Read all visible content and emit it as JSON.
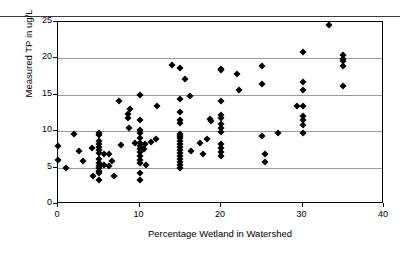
{
  "chart_data": {
    "type": "scatter",
    "title": "",
    "xlabel": "Percentage Wetland in Watershed",
    "ylabel": "Measured TP in ug/L",
    "xlim": [
      0,
      40
    ],
    "ylim": [
      0,
      25
    ],
    "xticks": [
      0,
      10,
      20,
      30,
      40
    ],
    "yticks": [
      0,
      5,
      10,
      15,
      20,
      25
    ],
    "xtick_labels": [
      "0",
      "10",
      "20",
      "30",
      "40"
    ],
    "ytick_labels": [
      "0",
      "5",
      "10",
      "15",
      "20",
      "25"
    ],
    "grid": "horizontal",
    "gridlines_y": [
      5,
      10,
      15,
      20
    ],
    "legend": "none",
    "marker": "diamond",
    "marker_color": "#000000",
    "series": [
      {
        "name": "Measured TP",
        "points": [
          [
            0.0,
            8.0
          ],
          [
            0.0,
            6.1
          ],
          [
            1.0,
            4.9
          ],
          [
            2.0,
            9.6
          ],
          [
            2.6,
            7.3
          ],
          [
            3.1,
            5.9
          ],
          [
            4.2,
            7.7
          ],
          [
            4.3,
            3.9
          ],
          [
            5.0,
            9.8
          ],
          [
            5.0,
            9.5
          ],
          [
            5.0,
            8.6
          ],
          [
            5.0,
            8.2
          ],
          [
            5.0,
            7.8
          ],
          [
            5.0,
            7.4
          ],
          [
            5.0,
            7.0
          ],
          [
            5.0,
            6.2
          ],
          [
            5.0,
            5.6
          ],
          [
            5.0,
            5.2
          ],
          [
            5.0,
            4.9
          ],
          [
            5.0,
            4.6
          ],
          [
            5.0,
            4.3
          ],
          [
            5.0,
            3.3
          ],
          [
            5.6,
            5.3
          ],
          [
            5.7,
            6.9
          ],
          [
            6.2,
            6.9
          ],
          [
            6.3,
            5.2
          ],
          [
            6.6,
            5.9
          ],
          [
            6.9,
            3.8
          ],
          [
            7.5,
            14.2
          ],
          [
            7.7,
            8.1
          ],
          [
            8.6,
            12.3
          ],
          [
            8.6,
            11.8
          ],
          [
            8.7,
            10.4
          ],
          [
            8.8,
            13.1
          ],
          [
            9.5,
            8.4
          ],
          [
            10.0,
            15.0
          ],
          [
            10.0,
            11.6
          ],
          [
            10.0,
            10.1
          ],
          [
            10.0,
            9.7
          ],
          [
            10.0,
            9.1
          ],
          [
            10.0,
            8.4
          ],
          [
            10.0,
            8.0
          ],
          [
            10.0,
            7.6
          ],
          [
            10.0,
            7.2
          ],
          [
            10.0,
            6.6
          ],
          [
            10.0,
            6.1
          ],
          [
            10.0,
            5.6
          ],
          [
            10.0,
            4.3
          ],
          [
            10.0,
            3.3
          ],
          [
            10.6,
            7.6
          ],
          [
            10.7,
            8.2
          ],
          [
            10.8,
            5.4
          ],
          [
            11.4,
            8.5
          ],
          [
            12.0,
            8.9
          ],
          [
            12.1,
            13.5
          ],
          [
            14.0,
            19.1
          ],
          [
            15.0,
            18.7
          ],
          [
            15.0,
            14.4
          ],
          [
            15.0,
            12.6
          ],
          [
            15.0,
            11.6
          ],
          [
            15.0,
            11.1
          ],
          [
            15.0,
            9.6
          ],
          [
            15.0,
            9.4
          ],
          [
            15.0,
            9.0
          ],
          [
            15.0,
            8.6
          ],
          [
            15.0,
            8.2
          ],
          [
            15.0,
            7.8
          ],
          [
            15.0,
            7.4
          ],
          [
            15.0,
            7.0
          ],
          [
            15.0,
            6.6
          ],
          [
            15.0,
            6.2
          ],
          [
            15.0,
            5.8
          ],
          [
            15.0,
            5.4
          ],
          [
            15.0,
            5.0
          ],
          [
            15.6,
            17.2
          ],
          [
            16.2,
            14.9
          ],
          [
            16.3,
            7.3
          ],
          [
            17.4,
            8.4
          ],
          [
            17.8,
            6.9
          ],
          [
            18.3,
            8.9
          ],
          [
            18.6,
            11.7
          ],
          [
            18.8,
            11.4
          ],
          [
            20.0,
            18.6
          ],
          [
            20.0,
            18.4
          ],
          [
            20.0,
            14.1
          ],
          [
            20.0,
            12.2
          ],
          [
            20.0,
            11.8
          ],
          [
            20.0,
            11.0
          ],
          [
            20.0,
            10.4
          ],
          [
            20.0,
            9.9
          ],
          [
            20.0,
            8.3
          ],
          [
            20.0,
            7.7
          ],
          [
            20.0,
            7.1
          ],
          [
            20.0,
            6.6
          ],
          [
            22.0,
            17.9
          ],
          [
            22.2,
            15.7
          ],
          [
            25.0,
            19.0
          ],
          [
            25.0,
            16.5
          ],
          [
            25.0,
            9.4
          ],
          [
            25.4,
            6.8
          ],
          [
            25.4,
            5.8
          ],
          [
            27.0,
            9.7
          ],
          [
            29.3,
            13.5
          ],
          [
            30.0,
            20.9
          ],
          [
            30.0,
            16.7
          ],
          [
            30.0,
            15.6
          ],
          [
            30.0,
            13.5
          ],
          [
            30.0,
            12.1
          ],
          [
            30.0,
            11.5
          ],
          [
            30.0,
            10.9
          ],
          [
            30.0,
            9.8
          ],
          [
            33.2,
            24.6
          ],
          [
            35.0,
            20.4
          ],
          [
            35.0,
            19.9
          ],
          [
            35.0,
            19.6
          ],
          [
            35.0,
            18.9
          ],
          [
            35.0,
            16.2
          ]
        ]
      }
    ]
  }
}
